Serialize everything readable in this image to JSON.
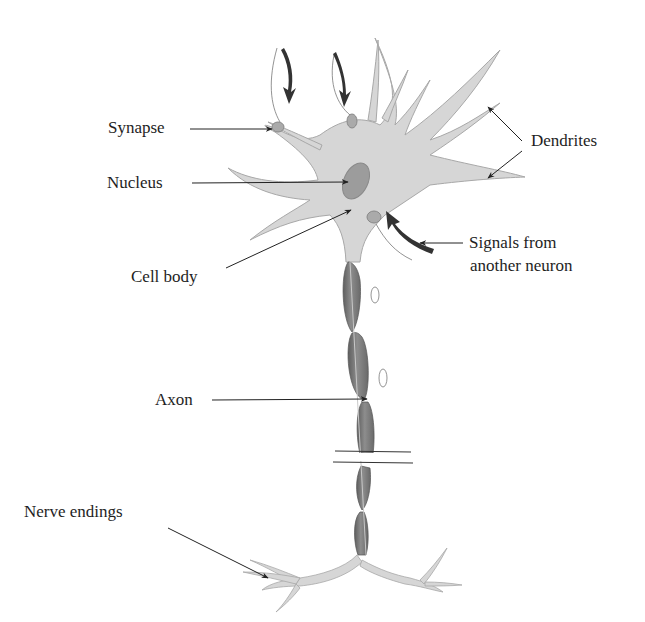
{
  "diagram": {
    "colors": {
      "cell_fill": "#d6d6d6",
      "cell_stroke": "#a8a8a8",
      "nucleus_fill": "#9c9c9c",
      "axon_fill": "#7a7a7a",
      "arrow": "#222222",
      "text": "#1e1e1e"
    },
    "labels": {
      "synapse": "Synapse",
      "nucleus": "Nucleus",
      "cell_body": "Cell body",
      "dendrites": "Dendrites",
      "signals_line1": "Signals from",
      "signals_line2": "another neuron",
      "axon": "Axon",
      "nerve_endings": "Nerve endings"
    }
  }
}
